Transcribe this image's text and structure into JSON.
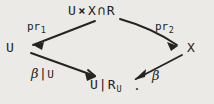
{
  "diagram": {
    "type": "commutative-diagram",
    "shape": "diamond",
    "background_color": "#eceae6",
    "ink_color": "#262422",
    "nodes": {
      "apex": {
        "label": "U × X ∩ R",
        "parts": {
          "first": "U",
          "operator": "×",
          "second": "X",
          "intersection": "∩",
          "third": "R"
        }
      },
      "left": {
        "label": "U"
      },
      "right": {
        "label": "X"
      },
      "bottom": {
        "label": "U|R_U",
        "parts": {
          "base": "U",
          "bar": "|",
          "relation": "R",
          "subscript": "U"
        }
      },
      "period": "."
    },
    "edges": {
      "apex_to_left": {
        "label": "pr",
        "subscript": "1",
        "from": "apex",
        "to": "left"
      },
      "apex_to_right": {
        "label": "pr",
        "subscript": "2",
        "from": "apex",
        "to": "right"
      },
      "left_to_bottom": {
        "label": "β|U",
        "parts": {
          "greek": "β",
          "bar": "|",
          "set": "U"
        },
        "from": "left",
        "to": "bottom"
      },
      "right_to_bottom": {
        "label": "β",
        "parts": {
          "greek": "β"
        },
        "from": "right",
        "to": "bottom"
      }
    }
  }
}
